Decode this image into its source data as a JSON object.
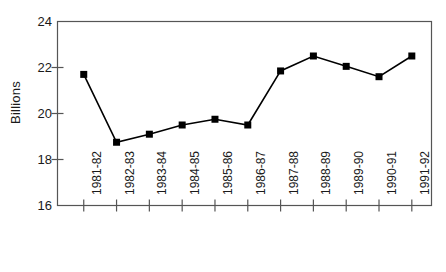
{
  "chart_data": {
    "type": "line",
    "title": "",
    "subtitle": "",
    "xlabel": "",
    "ylabel": "Billions",
    "categories": [
      "1981-82",
      "1982-83",
      "1983-84",
      "1984-85",
      "1985-86",
      "1986-87",
      "1987-88",
      "1988-89",
      "1989-90",
      "1990-91",
      "1991-92"
    ],
    "values": [
      21.7,
      18.75,
      19.1,
      19.5,
      19.75,
      19.5,
      21.85,
      22.5,
      22.05,
      21.6,
      22.5
    ],
    "series": [
      {
        "name": "Billions",
        "values": [
          21.7,
          18.75,
          19.1,
          19.5,
          19.75,
          19.5,
          21.85,
          22.5,
          22.05,
          21.6,
          22.5
        ]
      }
    ],
    "ylim": [
      16,
      24
    ],
    "yticks": [
      16,
      18,
      20,
      22,
      24
    ],
    "ytick_labels": [
      "16",
      "18",
      "20",
      "22",
      "24"
    ],
    "grid": false,
    "legend": false,
    "legend_position": "none",
    "marker": "square",
    "line_color": "#000000",
    "marker_color": "#000000",
    "frame_color": "#555555",
    "background": "#ffffff",
    "annotations": []
  }
}
